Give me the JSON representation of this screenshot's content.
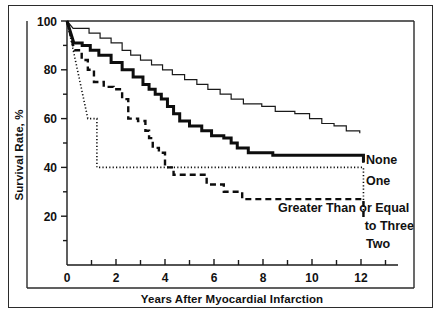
{
  "figure": {
    "name": "kaplan-meier-survival-figure",
    "frame_color": "#2b2b2b",
    "background": "#ffffff"
  },
  "chart_data": {
    "type": "line",
    "title": "",
    "subtitle": "",
    "xlabel": "Years After Myocardial Infarction",
    "ylabel": "Survival Rate, %",
    "xlim": [
      0,
      13.4
    ],
    "ylim": [
      0,
      100
    ],
    "xticks": [
      0,
      1,
      2,
      3,
      4,
      5,
      6,
      7,
      8,
      9,
      10,
      11,
      12,
      13
    ],
    "xtick_labels": [
      "0",
      "",
      "2",
      "",
      "4",
      "",
      "6",
      "",
      "8",
      "",
      "10",
      "",
      "12",
      ""
    ],
    "yticks": [
      0,
      10,
      20,
      30,
      40,
      50,
      60,
      70,
      80,
      90,
      100
    ],
    "ytick_labels": [
      "",
      "",
      "20",
      "",
      "40",
      "",
      "60",
      "",
      "80",
      "",
      "100"
    ],
    "grid": false,
    "legend_position": "inline-right",
    "step_type": "post",
    "series": [
      {
        "name": "None",
        "label": "None",
        "style": "solid-thin",
        "color": "#1a1a1a",
        "line_width": 1.2,
        "x": [
          0,
          0.25,
          0.9,
          1.35,
          1.8,
          2.25,
          2.6,
          3.0,
          3.45,
          3.9,
          4.3,
          4.8,
          5.3,
          5.75,
          6.25,
          6.7,
          7.2,
          7.95,
          8.5,
          9.3,
          9.9,
          10.4,
          10.9,
          11.4,
          11.95
        ],
        "y": [
          100,
          97,
          95,
          93,
          91,
          88,
          86,
          84,
          82,
          80,
          78,
          76,
          74,
          72,
          70,
          68,
          66,
          65,
          63,
          62,
          60,
          58,
          57,
          55,
          54
        ]
      },
      {
        "name": "One",
        "label": "One",
        "style": "solid-thick",
        "color": "#0d0d0d",
        "line_width": 3.0,
        "x": [
          0,
          0.28,
          0.62,
          0.95,
          1.3,
          1.8,
          2.25,
          2.7,
          3.1,
          3.35,
          3.6,
          3.85,
          4.1,
          4.35,
          4.6,
          5.0,
          5.5,
          5.9,
          6.4,
          6.7,
          6.95,
          7.4,
          8.4,
          12.1
        ],
        "y": [
          100,
          91,
          90,
          88,
          86,
          83,
          80,
          77,
          74,
          72,
          70,
          68,
          65,
          62,
          59,
          57,
          55,
          53,
          52,
          50,
          48,
          46,
          45,
          42
        ]
      },
      {
        "name": "Two",
        "label": "Two",
        "style": "dashed",
        "color": "#0d0d0d",
        "line_width": 2.4,
        "x": [
          0,
          0.3,
          0.6,
          0.85,
          1.1,
          1.5,
          1.9,
          2.25,
          2.5,
          2.9,
          3.2,
          3.35,
          3.5,
          3.75,
          4.0,
          4.35,
          5.7,
          6.4,
          7.15,
          12.1
        ],
        "y": [
          100,
          88,
          84,
          80,
          75,
          73,
          72,
          68,
          60,
          59,
          55,
          52,
          48,
          46,
          40,
          37,
          33,
          30,
          27,
          18
        ]
      },
      {
        "name": "Greater Than or Equal to Three",
        "label": "Greater Than or Equal\nto Three",
        "label_line1": "Greater Than or Equal",
        "label_line2": "to Three",
        "style": "dotted",
        "color": "#0d0d0d",
        "line_width": 1.6,
        "x": [
          0,
          0.2,
          0.4,
          0.62,
          0.85,
          1.22,
          12.1
        ],
        "y": [
          100,
          92,
          80,
          70,
          60,
          40,
          20
        ]
      }
    ],
    "annotations": [
      {
        "text": "None",
        "series": "None"
      },
      {
        "text": "One",
        "series": "One"
      },
      {
        "text": "Greater Than or Equal",
        "series": "Greater Than or Equal to Three"
      },
      {
        "text": "to Three",
        "series": "Greater Than or Equal to Three"
      },
      {
        "text": "Two",
        "series": "Two"
      }
    ]
  },
  "labels": {
    "y_axis_title": "Survival Rate, %",
    "x_axis_title": "Years After Myocardial Infarction",
    "x0": "0",
    "x2": "2",
    "x4": "4",
    "x6": "6",
    "x8": "8",
    "x10": "10",
    "x12": "12",
    "y20": "20",
    "y40": "40",
    "y60": "60",
    "y80": "80",
    "y100": "100",
    "series_none": "None",
    "series_one": "One",
    "series_gte_three_line1": "Greater Than or Equal",
    "series_gte_three_line2": "to Three",
    "series_two": "Two"
  }
}
